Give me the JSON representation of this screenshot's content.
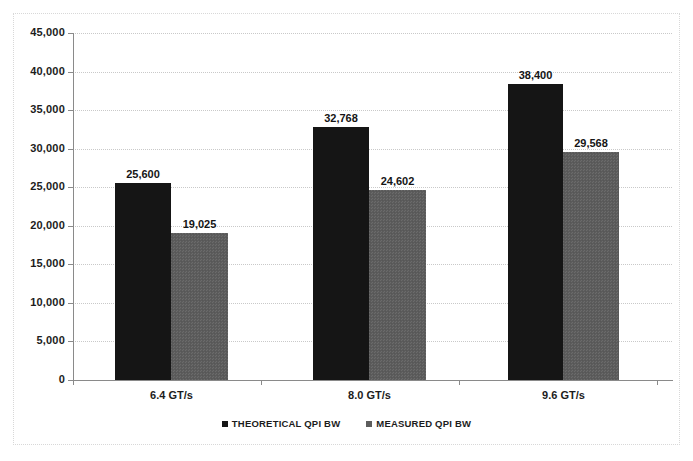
{
  "chart_data": {
    "type": "bar",
    "title": "",
    "subtitle": "",
    "xlabel": "",
    "ylabel": "",
    "categories": [
      "6.4 GT/s",
      "8.0 GT/s",
      "9.6 GT/s"
    ],
    "series": [
      {
        "name": "THEORETICAL QPI BW",
        "color": "#151515",
        "values": [
          25600,
          32768,
          38400
        ],
        "labels": [
          "25,600",
          "32,768",
          "38,400"
        ]
      },
      {
        "name": "MEASURED QPI BW",
        "color": "#5d5d5d",
        "values": [
          19025,
          24602,
          29568
        ],
        "labels": [
          "19,025",
          "24,602",
          "29,568"
        ]
      }
    ],
    "ylim": [
      0,
      45000
    ],
    "ytick_step": 5000,
    "yticks": [
      0,
      5000,
      10000,
      15000,
      20000,
      25000,
      30000,
      35000,
      40000,
      45000
    ],
    "ytick_labels": [
      "0",
      "5,000",
      "10,000",
      "15,000",
      "20,000",
      "25,000",
      "30,000",
      "35,000",
      "40,000",
      "45,000"
    ],
    "grid": true,
    "grid_style": "dotted",
    "grid_color": "#c9c9c9",
    "legend_position": "bottom",
    "axis_color": "#8a8a8a",
    "background": "#ffffff"
  },
  "legend": {
    "items": [
      {
        "label": "THEORETICAL QPI BW",
        "swatch": "legend-swatch-theoretical"
      },
      {
        "label": "MEASURED QPI BW",
        "swatch": "legend-swatch-measured"
      }
    ]
  }
}
